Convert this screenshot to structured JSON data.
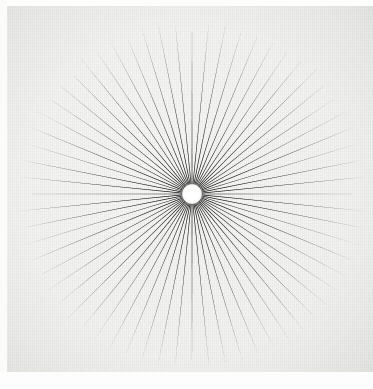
{
  "artwork": {
    "title": "Radial Starburst",
    "medium_description": "Photographic print of a black radial sunburst on off-white paper",
    "canvas": {
      "width": 373,
      "height": 389
    }
  },
  "colors": {
    "ray": "#0d0d0d",
    "ray_tip": "#3a3a3a",
    "paper_light": "#f6f6f4",
    "paper_mid": "#f0f0ee",
    "paper_dark": "#e3e3df",
    "hub": "#ffffff",
    "margin": "#fdfdfc"
  },
  "chart_data": {
    "type": "pie",
    "subtitle": "Sunburst of tapered black rays radiating from a central white hub",
    "center": {
      "x": 192,
      "y": 194
    },
    "hub_radius": 9.5,
    "outer_radius": 177,
    "ray_count": 64,
    "angular_step_degrees": 5.625,
    "start_angle_degrees": -90,
    "ray_half_width_degrees_at_hub": 2.1,
    "ray_tip_taper": "point",
    "xlabel": "",
    "ylabel": "",
    "grid": false,
    "legend": "none",
    "categories": [
      "ray-01",
      "ray-02",
      "ray-03",
      "ray-04",
      "ray-05",
      "ray-06",
      "ray-07",
      "ray-08",
      "ray-09",
      "ray-10",
      "ray-11",
      "ray-12",
      "ray-13",
      "ray-14",
      "ray-15",
      "ray-16",
      "ray-17",
      "ray-18",
      "ray-19",
      "ray-20",
      "ray-21",
      "ray-22",
      "ray-23",
      "ray-24",
      "ray-25",
      "ray-26",
      "ray-27",
      "ray-28",
      "ray-29",
      "ray-30",
      "ray-31",
      "ray-32",
      "ray-33",
      "ray-34",
      "ray-35",
      "ray-36",
      "ray-37",
      "ray-38",
      "ray-39",
      "ray-40",
      "ray-41",
      "ray-42",
      "ray-43",
      "ray-44",
      "ray-45",
      "ray-46",
      "ray-47",
      "ray-48",
      "ray-49",
      "ray-50",
      "ray-51",
      "ray-52",
      "ray-53",
      "ray-54",
      "ray-55",
      "ray-56",
      "ray-57",
      "ray-58",
      "ray-59",
      "ray-60",
      "ray-61",
      "ray-62",
      "ray-63",
      "ray-64"
    ],
    "values": [
      177,
      176,
      177,
      175,
      176,
      177,
      176,
      175,
      177,
      176,
      175,
      177,
      176,
      177,
      175,
      176,
      177,
      175,
      176,
      177,
      176,
      175,
      177,
      176,
      175,
      177,
      176,
      177,
      175,
      176,
      177,
      176,
      177,
      176,
      177,
      175,
      176,
      177,
      176,
      175,
      177,
      176,
      175,
      177,
      176,
      177,
      175,
      176,
      177,
      175,
      176,
      177,
      176,
      175,
      177,
      176,
      175,
      177,
      176,
      177,
      175,
      176,
      177,
      176
    ],
    "ylim": [
      0,
      180
    ]
  },
  "layout": {
    "margin_top_px": 6,
    "margin_left_px": 7,
    "margin_bottom_px": 17
  }
}
